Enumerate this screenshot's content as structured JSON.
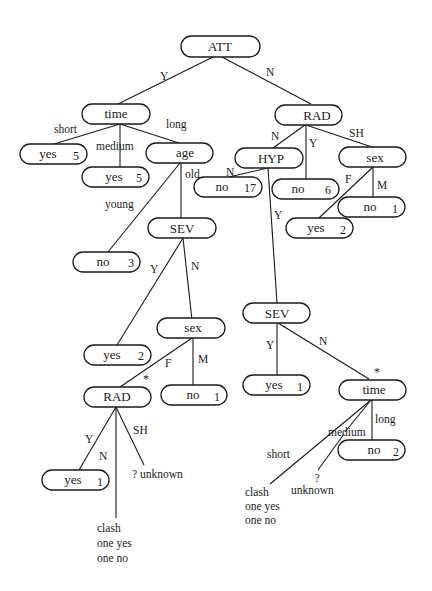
{
  "diagram": {
    "type": "decision-tree",
    "nodes": {
      "att": {
        "label": "ATT"
      },
      "time1": {
        "label": "time"
      },
      "yes_short": {
        "label": "yes",
        "count": "5"
      },
      "yes_medium": {
        "label": "yes",
        "count": "5"
      },
      "age": {
        "label": "age"
      },
      "no_young": {
        "label": "no",
        "count": "3"
      },
      "sev1": {
        "label": "SEV"
      },
      "yes_sev1": {
        "label": "yes",
        "count": "2"
      },
      "sex1": {
        "label": "sex"
      },
      "rad2": {
        "label": "RAD",
        "mark": "*"
      },
      "no_sex1_m": {
        "label": "no",
        "count": "1"
      },
      "yes_rad2": {
        "label": "yes",
        "count": "1"
      },
      "rad1": {
        "label": "RAD"
      },
      "hyp": {
        "label": "HYP"
      },
      "no_hyp": {
        "label": "no",
        "count": "17"
      },
      "no_rad1_y": {
        "label": "no",
        "count": "6"
      },
      "sex2": {
        "label": "sex"
      },
      "no_sex2_m": {
        "label": "no",
        "count": "1"
      },
      "yes_sex2_f": {
        "label": "yes",
        "count": "2"
      },
      "sev2": {
        "label": "SEV"
      },
      "yes_sev2": {
        "label": "yes",
        "count": "1"
      },
      "time2": {
        "label": "time",
        "mark": "*"
      },
      "no_time2_long": {
        "label": "no",
        "count": "2"
      }
    },
    "edge_labels": {
      "att_y": "Y",
      "att_n": "N",
      "time1_short": "short",
      "time1_medium": "medium",
      "time1_long": "long",
      "age_old": "old",
      "age_young": "young",
      "sev1_y": "Y",
      "sev1_n": "N",
      "sex1_f": "F",
      "sex1_m": "M",
      "rad2_y": "Y",
      "rad2_n": "N",
      "rad2_sh": "SH",
      "rad1_n": "N",
      "rad1_y": "Y",
      "rad1_sh": "SH",
      "hyp_n": "N",
      "hyp_y": "Y",
      "sex2_f": "F",
      "sex2_m": "M",
      "sev2_y": "Y",
      "sev2_n": "N",
      "time2_short": "short",
      "time2_medium": "medium",
      "time2_long": "long"
    },
    "leaf_texts": {
      "rad2_unknown": "? unknown",
      "rad2_clash": [
        "clash",
        "one yes",
        "one no"
      ],
      "time2_unknown_q": "?",
      "time2_unknown": "unknown",
      "time2_clash": [
        "clash",
        "one yes",
        "one no"
      ]
    }
  }
}
